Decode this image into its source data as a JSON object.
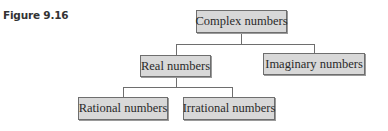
{
  "figure": {
    "label": "Figure 9.16"
  },
  "diagram": {
    "type": "tree",
    "nodes": {
      "complex": "Complex numbers",
      "real": "Real numbers",
      "imaginary": "Imaginary numbers",
      "rational": "Rational numbers",
      "irrational": "Irrational numbers"
    },
    "edges": [
      [
        "Complex numbers",
        "Real numbers"
      ],
      [
        "Complex numbers",
        "Imaginary numbers"
      ],
      [
        "Real numbers",
        "Rational numbers"
      ],
      [
        "Real numbers",
        "Irrational numbers"
      ]
    ],
    "colors": {
      "box_fill": "#d8d8d8",
      "box_border": "#6e6e6e",
      "text": "#2a2a2a"
    }
  }
}
